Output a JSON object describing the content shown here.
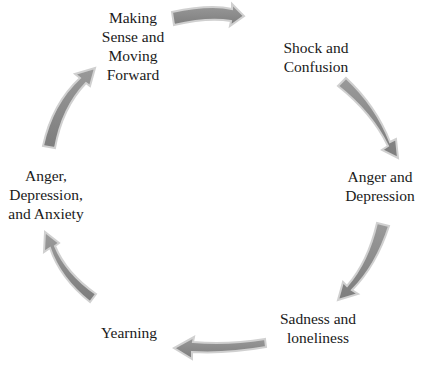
{
  "diagram": {
    "type": "cycle",
    "nodes": [
      {
        "id": "making-sense",
        "label": "Making\nSense and\nMoving\nForward"
      },
      {
        "id": "shock",
        "label": "Shock and\nConfusion"
      },
      {
        "id": "anger-depression",
        "label": "Anger and\nDepression"
      },
      {
        "id": "sadness",
        "label": "Sadness and\nloneliness"
      },
      {
        "id": "yearning",
        "label": "Yearning"
      },
      {
        "id": "anger-depression-anxiety",
        "label": "Anger,\nDepression,\nand Anxiety"
      }
    ],
    "edges": [
      {
        "from": "making-sense",
        "to": "shock"
      },
      {
        "from": "shock",
        "to": "anger-depression"
      },
      {
        "from": "anger-depression",
        "to": "sadness"
      },
      {
        "from": "sadness",
        "to": "yearning"
      },
      {
        "from": "yearning",
        "to": "anger-depression-anxiety"
      },
      {
        "from": "anger-depression-anxiety",
        "to": "making-sense"
      }
    ],
    "colors": {
      "arrow_fill": "#8c8c8c",
      "arrow_stroke": "#d6d6d6",
      "text": "#1a1a1a"
    }
  }
}
